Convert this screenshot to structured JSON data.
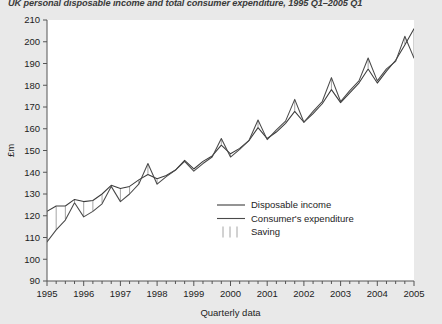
{
  "chart_data": {
    "type": "line",
    "title": "UK personal disposable income and total consumer expenditure, 1995 Q1–2005 Q1",
    "xlabel": "Quarterly data",
    "ylabel": "£m",
    "ylim": [
      90,
      210
    ],
    "ytick_step": 10,
    "yticks": [
      90,
      100,
      110,
      120,
      130,
      140,
      150,
      160,
      170,
      180,
      190,
      200,
      210
    ],
    "xticks": [
      1995,
      1996,
      1997,
      1998,
      1999,
      2000,
      2001,
      2002,
      2003,
      2004,
      2005
    ],
    "xlim": [
      1995,
      2005.0
    ],
    "minor_ticks_per_year": 4,
    "grid": false,
    "legend_position": "inside-lower-right",
    "x": [
      "1995 Q1",
      "1995 Q2",
      "1995 Q3",
      "1995 Q4",
      "1996 Q1",
      "1996 Q2",
      "1996 Q3",
      "1996 Q4",
      "1997 Q1",
      "1997 Q2",
      "1997 Q3",
      "1997 Q4",
      "1998 Q1",
      "1998 Q2",
      "1998 Q3",
      "1998 Q4",
      "1999 Q1",
      "1999 Q2",
      "1999 Q3",
      "1999 Q4",
      "2000 Q1",
      "2000 Q2",
      "2000 Q3",
      "2000 Q4",
      "2001 Q1",
      "2001 Q2",
      "2001 Q3",
      "2001 Q4",
      "2002 Q1",
      "2002 Q2",
      "2002 Q3",
      "2002 Q4",
      "2003 Q1",
      "2003 Q2",
      "2003 Q3",
      "2003 Q4",
      "2004 Q1",
      "2004 Q2",
      "2004 Q3",
      "2004 Q4",
      "2005 Q1"
    ],
    "series": [
      {
        "name": "Disposable income",
        "color": "#3c3c3c",
        "values": [
          122.0,
          124.5,
          124.5,
          127.5,
          126.5,
          127.0,
          130.0,
          134.0,
          132.5,
          133.5,
          136.5,
          139.0,
          137.0,
          138.5,
          141.0,
          145.5,
          141.5,
          145.0,
          147.5,
          152.5,
          148.5,
          151.0,
          154.5,
          160.5,
          155.5,
          158.5,
          162.5,
          168.0,
          163.0,
          167.0,
          171.5,
          178.0,
          172.0,
          176.5,
          181.0,
          187.5,
          181.0,
          186.5,
          191.5,
          198.5,
          206.0
        ]
      },
      {
        "name": "Consumer's expenditure",
        "color": "#4a4a4a",
        "values": [
          108.0,
          113.5,
          118.0,
          126.0,
          119.5,
          122.0,
          125.5,
          133.5,
          126.5,
          130.0,
          134.5,
          144.0,
          134.5,
          138.0,
          141.0,
          145.0,
          140.5,
          144.0,
          147.0,
          155.5,
          147.0,
          150.5,
          154.5,
          164.0,
          155.0,
          159.5,
          163.5,
          173.5,
          163.0,
          168.0,
          172.5,
          183.5,
          172.5,
          177.5,
          182.0,
          192.5,
          182.0,
          187.5,
          191.0,
          202.5,
          192.5
        ]
      }
    ],
    "band_series": {
      "name": "Saving",
      "description": "Vertical hatch band drawn between disposable income and consumer's expenditure where income exceeds expenditure"
    }
  },
  "legend": {
    "items": [
      {
        "label": "Disposable income",
        "marker": "line"
      },
      {
        "label": "Consumer's expenditure",
        "marker": "line"
      },
      {
        "label": "Saving",
        "marker": "hatch"
      }
    ]
  },
  "colors": {
    "page_background": "#e9e9e9",
    "plot_background": "#ffffff",
    "axis": "#555555",
    "line_primary": "#3c3c3c",
    "line_secondary": "#4a4a4a",
    "hatch": "#9a9a9a",
    "text": "#1d1d1d",
    "title_text": "#3a3a3a"
  }
}
